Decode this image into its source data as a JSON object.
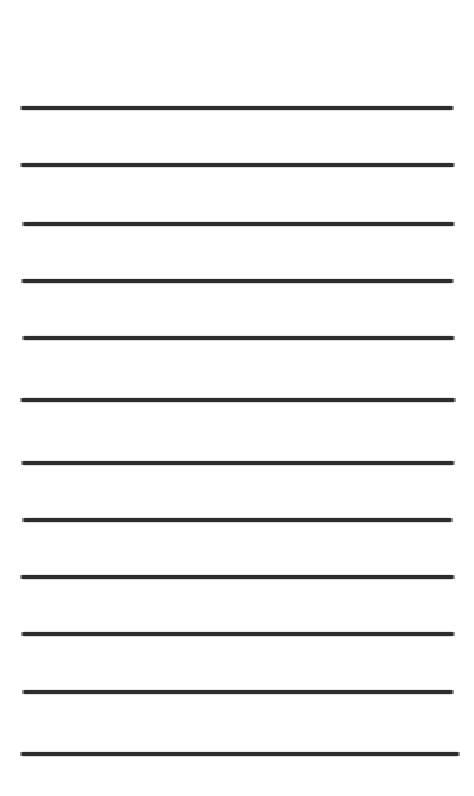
{
  "document": {
    "kind": "ruled-paper-sheet",
    "title": "Blank ruled paper sheet",
    "width": 474,
    "height": 796,
    "background_color": "#ffffff",
    "ink_color": "#2d2d2d",
    "line_count": 12,
    "line_thickness": 4,
    "top_margin": 106,
    "bottom_margin": 38,
    "average_line_spacing": 57,
    "text_content": ""
  },
  "chart_data": {
    "type": "line",
    "title": "Blank ruled paper sheet",
    "xlabel": "",
    "ylabel": "",
    "grid": false,
    "legend": "none",
    "xlim": [
      0,
      474
    ],
    "ylim": [
      0,
      796
    ],
    "categories": [
      "rule-1",
      "rule-2",
      "rule-3",
      "rule-4",
      "rule-5",
      "rule-6",
      "rule-7",
      "rule-8",
      "rule-9",
      "rule-10",
      "rule-11",
      "rule-12"
    ],
    "values": [
      108,
      165,
      224,
      281,
      338,
      400,
      463,
      520,
      577,
      634,
      692,
      754
    ],
    "series": [
      {
        "name": "ruled-lines",
        "values": [
          108,
          165,
          224,
          281,
          338,
          400,
          463,
          520,
          577,
          634,
          692,
          754
        ]
      }
    ]
  },
  "lines": [
    {
      "id": "rule-1",
      "index": 1,
      "y": 108,
      "x_start": 22,
      "x_end": 452,
      "thickness": 4
    },
    {
      "id": "rule-2",
      "index": 2,
      "y": 165,
      "x_start": 22,
      "x_end": 453,
      "thickness": 4
    },
    {
      "id": "rule-3",
      "index": 3,
      "y": 224,
      "x_start": 24,
      "x_end": 453,
      "thickness": 4
    },
    {
      "id": "rule-4",
      "index": 4,
      "y": 281,
      "x_start": 23,
      "x_end": 452,
      "thickness": 4
    },
    {
      "id": "rule-5",
      "index": 5,
      "y": 338,
      "x_start": 24,
      "x_end": 453,
      "thickness": 4
    },
    {
      "id": "rule-6",
      "index": 6,
      "y": 400,
      "x_start": 22,
      "x_end": 454,
      "thickness": 4
    },
    {
      "id": "rule-7",
      "index": 7,
      "y": 463,
      "x_start": 23,
      "x_end": 453,
      "thickness": 4
    },
    {
      "id": "rule-8",
      "index": 8,
      "y": 520,
      "x_start": 24,
      "x_end": 451,
      "thickness": 4
    },
    {
      "id": "rule-9",
      "index": 9,
      "y": 577,
      "x_start": 22,
      "x_end": 453,
      "thickness": 4
    },
    {
      "id": "rule-10",
      "index": 10,
      "y": 634,
      "x_start": 23,
      "x_end": 453,
      "thickness": 4
    },
    {
      "id": "rule-11",
      "index": 11,
      "y": 692,
      "x_start": 24,
      "x_end": 452,
      "thickness": 4
    },
    {
      "id": "rule-12",
      "index": 12,
      "y": 754,
      "x_start": 22,
      "x_end": 458,
      "thickness": 4
    }
  ]
}
